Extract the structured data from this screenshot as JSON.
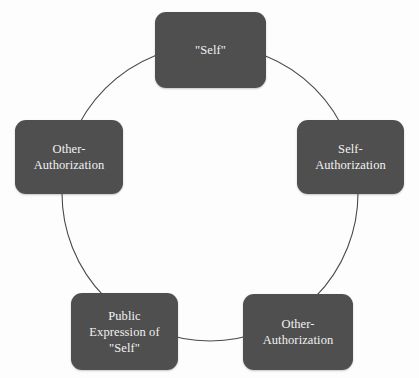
{
  "diagram": {
    "type": "cycle",
    "shape": "circle",
    "node_count": 5,
    "ring": {
      "center_x": 210,
      "center_y": 193,
      "radius": 148,
      "stroke_color": "#4a4a4a",
      "stroke_width": 1
    },
    "style": {
      "node_fill": "#4f4f4f",
      "node_text_color": "#f2f2f2",
      "background": "#fdfdfd",
      "corner_radius": 11
    },
    "nodes": [
      {
        "id": "self",
        "position": "top",
        "label": "\"Self\""
      },
      {
        "id": "self-authorization",
        "position": "right",
        "label": "Self-\nAuthorization"
      },
      {
        "id": "other-authorization-bottom-right",
        "position": "bottom-right",
        "label": "Other-\nAuthorization"
      },
      {
        "id": "public-expression-of-self",
        "position": "bottom-left",
        "label": "Public\nExpression of\n\"Self\""
      },
      {
        "id": "other-authorization-left",
        "position": "left",
        "label": "Other-\nAuthorization"
      }
    ]
  }
}
